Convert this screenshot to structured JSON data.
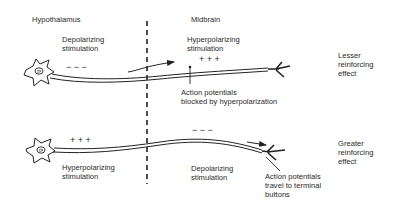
{
  "regions": {
    "left": "Hypothalamus",
    "right": "Midbrain"
  },
  "top_neuron": {
    "left_stimulation": [
      "Depolarizing",
      "stimulation"
    ],
    "left_charges": "−   −   −",
    "right_stimulation": [
      "Hyperpolarizing",
      "stimulation"
    ],
    "right_charges": "+   +   +",
    "annotation": [
      "Action potentials",
      "blocked by hyperpolarization"
    ],
    "effect": [
      "Lesser",
      "reinforcing",
      "effect"
    ]
  },
  "bottom_neuron": {
    "left_stimulation": [
      "Hyperpolarizing",
      "stimulation"
    ],
    "left_charges": "+   +   +",
    "right_stimulation": [
      "Depolarizing",
      "stimulation"
    ],
    "right_charges": "−   −   −",
    "annotation": [
      "Action potentials",
      "travel to terminal",
      "buttons"
    ],
    "effect": [
      "Greater",
      "reinforcing",
      "effect"
    ]
  }
}
